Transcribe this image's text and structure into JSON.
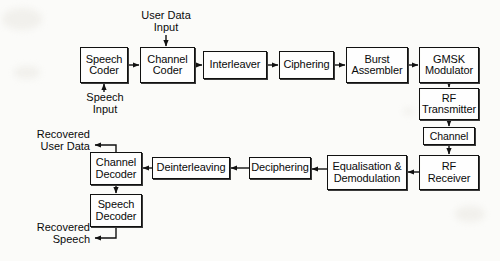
{
  "diagram": {
    "background_color": "#fbfbf9",
    "line_color": "#111111",
    "box_fill": "#fefefe",
    "nodes": [
      {
        "id": "speech-coder",
        "label": "Speech\nCoder",
        "x": 80,
        "y": 47,
        "w": 48,
        "h": 36
      },
      {
        "id": "channel-coder",
        "label": "Channel\nCoder",
        "x": 140,
        "y": 47,
        "w": 55,
        "h": 36
      },
      {
        "id": "interleaver",
        "label": "Interleaver",
        "x": 203,
        "y": 51,
        "w": 64,
        "h": 28
      },
      {
        "id": "ciphering",
        "label": "Ciphering",
        "x": 279,
        "y": 51,
        "w": 55,
        "h": 28
      },
      {
        "id": "burst-assembler",
        "label": "Burst\nAssembler",
        "x": 346,
        "y": 47,
        "w": 62,
        "h": 36
      },
      {
        "id": "gmsk-modulator",
        "label": "GMSK\nModulator",
        "x": 419,
        "y": 47,
        "w": 60,
        "h": 36
      },
      {
        "id": "rf-transmitter",
        "label": "RF\nTransmitter",
        "x": 419,
        "y": 88,
        "w": 60,
        "h": 32
      },
      {
        "id": "channel",
        "label": "Channel",
        "x": 423,
        "y": 127,
        "w": 52,
        "h": 18
      },
      {
        "id": "rf-receiver",
        "label": "RF\nReceiver",
        "x": 419,
        "y": 155,
        "w": 60,
        "h": 35
      },
      {
        "id": "equalisation",
        "label": "Equalisation &\nDemodulation",
        "x": 327,
        "y": 155,
        "w": 80,
        "h": 35
      },
      {
        "id": "deciphering",
        "label": "Deciphering",
        "x": 249,
        "y": 157,
        "w": 62,
        "h": 22
      },
      {
        "id": "deinterleaving",
        "label": "Deinterleaving",
        "x": 152,
        "y": 157,
        "w": 78,
        "h": 22
      },
      {
        "id": "channel-decoder",
        "label": "Channel\nDecoder",
        "x": 90,
        "y": 152,
        "w": 52,
        "h": 33
      },
      {
        "id": "speech-decoder",
        "label": "Speech\nDecoder",
        "x": 90,
        "y": 194,
        "w": 52,
        "h": 33
      }
    ],
    "labels": [
      {
        "id": "user-data-input",
        "text": "User Data\nInput",
        "x": 127,
        "y": 9,
        "w": 78,
        "align": "center"
      },
      {
        "id": "speech-input",
        "text": "Speech\nInput",
        "x": 76,
        "y": 91,
        "w": 58,
        "align": "center"
      },
      {
        "id": "recovered-user-data",
        "text": "Recovered\nUser Data",
        "x": 8,
        "y": 128,
        "w": 80,
        "align": "right"
      },
      {
        "id": "recovered-speech",
        "text": "Recovered\nSpeech",
        "x": 8,
        "y": 221,
        "w": 80,
        "align": "right"
      }
    ],
    "connections": [
      {
        "id": "user-data-to-channel-coder",
        "from": "user-data-input",
        "to": "channel-coder",
        "kind": "arrow-down"
      },
      {
        "id": "speech-input-to-coder",
        "from": "speech-input",
        "to": "speech-coder",
        "kind": "arrow-up"
      },
      {
        "id": "speech-to-channel-coder",
        "from": "speech-coder",
        "to": "channel-coder",
        "kind": "arrow-right"
      },
      {
        "id": "channel-coder-to-interleaver",
        "from": "channel-coder",
        "to": "interleaver",
        "kind": "arrow-right"
      },
      {
        "id": "interleaver-to-ciphering",
        "from": "interleaver",
        "to": "ciphering",
        "kind": "arrow-right"
      },
      {
        "id": "ciphering-to-burst",
        "from": "ciphering",
        "to": "burst-assembler",
        "kind": "arrow-right"
      },
      {
        "id": "burst-to-gmsk",
        "from": "burst-assembler",
        "to": "gmsk-modulator",
        "kind": "arrow-right"
      },
      {
        "id": "gmsk-to-rf-transmitter",
        "from": "gmsk-modulator",
        "to": "rf-transmitter",
        "kind": "arrow-down"
      },
      {
        "id": "rf-transmitter-to-channel",
        "from": "rf-transmitter",
        "to": "channel",
        "kind": "arrow-down"
      },
      {
        "id": "channel-to-rf-receiver",
        "from": "channel",
        "to": "rf-receiver",
        "kind": "arrow-down"
      },
      {
        "id": "rf-receiver-to-equalisation",
        "from": "rf-receiver",
        "to": "equalisation",
        "kind": "arrow-left"
      },
      {
        "id": "equalisation-to-deciphering",
        "from": "equalisation",
        "to": "deciphering",
        "kind": "arrow-left"
      },
      {
        "id": "deciphering-to-deinterleaving",
        "from": "deciphering",
        "to": "deinterleaving",
        "kind": "arrow-left"
      },
      {
        "id": "deinterleaving-to-channel-decoder",
        "from": "deinterleaving",
        "to": "channel-decoder",
        "kind": "arrow-left"
      },
      {
        "id": "channel-decoder-to-recovered-user-data",
        "from": "channel-decoder",
        "to": "recovered-user-data",
        "kind": "elbow-up-left"
      },
      {
        "id": "channel-decoder-to-speech-decoder",
        "from": "channel-decoder",
        "to": "speech-decoder",
        "kind": "arrow-down"
      },
      {
        "id": "speech-decoder-to-recovered-speech",
        "from": "speech-decoder",
        "to": "recovered-speech",
        "kind": "elbow-down-left"
      }
    ]
  }
}
